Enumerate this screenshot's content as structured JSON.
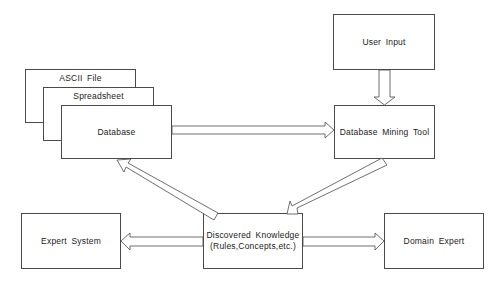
{
  "diagram": {
    "nodes": {
      "ascii_file": {
        "label": "ASCII File"
      },
      "spreadsheet": {
        "label": "Spreadsheet"
      },
      "database": {
        "label": "Database"
      },
      "user_input": {
        "label": "User Input"
      },
      "mining_tool": {
        "label": "Database Mining Tool"
      },
      "knowledge": {
        "line1": "Discovered Knowledge",
        "line2": "(Rules,Concepts,etc.)"
      },
      "expert_system": {
        "label": "Expert System"
      },
      "domain_expert": {
        "label": "Domain Expert"
      }
    },
    "edges": [
      {
        "from": "Database",
        "to": "Database Mining Tool"
      },
      {
        "from": "User Input",
        "to": "Database Mining Tool"
      },
      {
        "from": "Database Mining Tool",
        "to": "Discovered Knowledge"
      },
      {
        "from": "Discovered Knowledge",
        "to": "Database"
      },
      {
        "from": "Discovered Knowledge",
        "to": "Expert System"
      },
      {
        "from": "Discovered Knowledge",
        "to": "Domain Expert"
      }
    ],
    "colors": {
      "stroke": "#4a4a4a",
      "fill": "#ffffff",
      "text": "#222222"
    }
  }
}
